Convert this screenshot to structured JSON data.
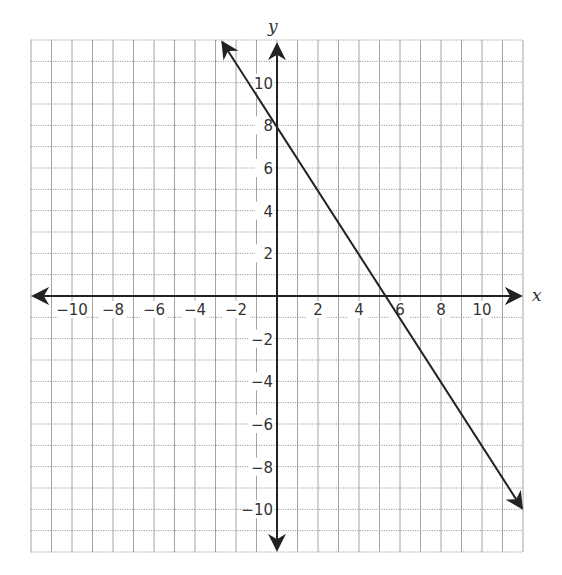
{
  "chart_data": {
    "type": "line",
    "title": "",
    "xlabel": "x",
    "ylabel": "y",
    "xlim": [
      -12,
      12
    ],
    "ylim": [
      -12,
      12
    ],
    "grid": true,
    "grid_step": 1,
    "x_ticks": [
      -10,
      -8,
      -6,
      -4,
      -2,
      2,
      4,
      6,
      8,
      10
    ],
    "x_tick_labels": [
      "−10",
      "−8",
      "−6",
      "−4",
      "−2",
      "2",
      "4",
      "6",
      "8",
      "10"
    ],
    "y_ticks": [
      10,
      8,
      6,
      4,
      2,
      -2,
      -4,
      -6,
      -8,
      -10
    ],
    "y_tick_labels": [
      "10",
      "8",
      "6",
      "4",
      "2",
      "−2",
      "−4",
      "−6",
      "−8",
      "−10"
    ],
    "series": [
      {
        "name": "line",
        "equation": "y = -1.5x + 8",
        "slope": -1.5,
        "y_intercept": 8,
        "x_intercept": 5.33,
        "x": [
          -2.67,
          12
        ],
        "y": [
          12,
          -10
        ],
        "arrows": "both",
        "color": "#222222"
      }
    ],
    "legend": null
  },
  "labels": {
    "x_axis": "x",
    "y_axis": "y"
  },
  "colors": {
    "grid": "#9a9a9a",
    "axis": "#222222",
    "line": "#222222",
    "background": "#ffffff"
  }
}
